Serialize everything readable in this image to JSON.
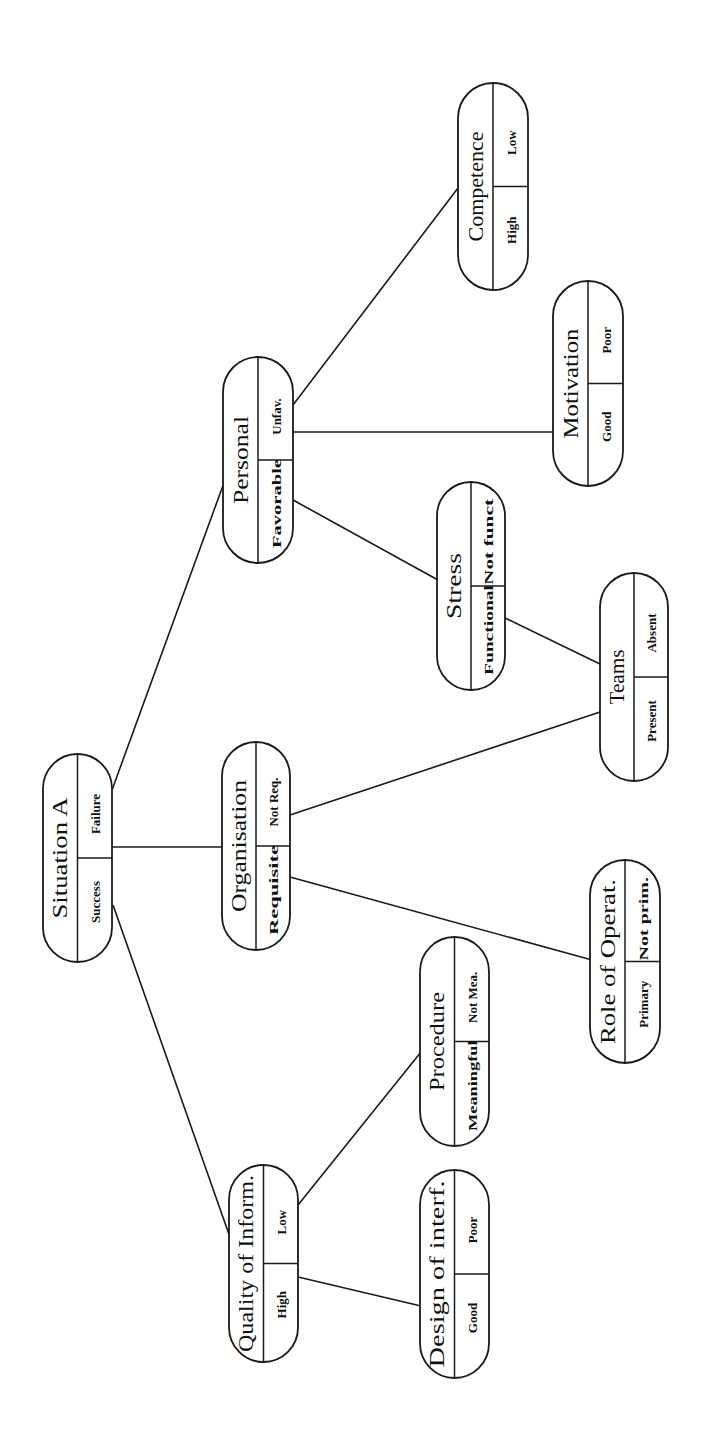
{
  "diagram": {
    "orientation": "rotated-90-ccw",
    "nodes": [
      {
        "id": "situation-a",
        "title": "Situation A",
        "left": "Success",
        "right": "Failure",
        "x": 43,
        "y": 754,
        "w": 69,
        "h": 208
      },
      {
        "id": "personal",
        "title": "Personal",
        "left": "Favorable",
        "right": "Unfav.",
        "x": 223,
        "y": 357,
        "w": 70,
        "h": 206
      },
      {
        "id": "organisation",
        "title": "Organisation",
        "left": "Requisite",
        "right": "Not Req.",
        "x": 222,
        "y": 742,
        "w": 68,
        "h": 208
      },
      {
        "id": "quality-of-inform",
        "title": "Quality of Inform.",
        "left": "High",
        "right": "Low",
        "x": 229,
        "y": 1165,
        "w": 69,
        "h": 197
      },
      {
        "id": "competence",
        "title": "Competence",
        "left": "High",
        "right": "Low",
        "x": 458,
        "y": 83,
        "w": 70,
        "h": 207
      },
      {
        "id": "motivation",
        "title": "Motivation",
        "left": "Good",
        "right": "Poor",
        "x": 553,
        "y": 281,
        "w": 70,
        "h": 205
      },
      {
        "id": "stress",
        "title": "Stress",
        "left": "Functional",
        "right": "Not funct",
        "x": 437,
        "y": 482,
        "w": 68,
        "h": 208
      },
      {
        "id": "teams",
        "title": "Teams",
        "left": "Present",
        "right": "Absent",
        "x": 600,
        "y": 573,
        "w": 68,
        "h": 208
      },
      {
        "id": "role-of-operat",
        "title": "Role of Operat.",
        "left": "Primary",
        "right": "Not prim.",
        "x": 590,
        "y": 860,
        "w": 70,
        "h": 203
      },
      {
        "id": "procedure",
        "title": "Procedure",
        "left": "Meaningful",
        "right": "Not Mea.",
        "x": 420,
        "y": 937,
        "w": 69,
        "h": 209
      },
      {
        "id": "design-of-interf",
        "title": "Design of interf.",
        "left": "Good",
        "right": "Poor",
        "x": 420,
        "y": 1170,
        "w": 69,
        "h": 208
      }
    ],
    "edges": [
      {
        "from": "situation-a",
        "to": "personal",
        "x1": 112,
        "y1": 790,
        "x2": 225,
        "y2": 480
      },
      {
        "from": "situation-a",
        "to": "organisation",
        "x1": 112,
        "y1": 847,
        "x2": 222,
        "y2": 847
      },
      {
        "from": "situation-a",
        "to": "quality-of-inform",
        "x1": 113,
        "y1": 905,
        "x2": 231,
        "y2": 1240
      },
      {
        "from": "personal",
        "to": "competence",
        "x1": 293,
        "y1": 405,
        "x2": 458,
        "y2": 188
      },
      {
        "from": "personal",
        "to": "motivation",
        "x1": 293,
        "y1": 432,
        "x2": 553,
        "y2": 432
      },
      {
        "from": "personal",
        "to": "stress",
        "x1": 293,
        "y1": 500,
        "x2": 438,
        "y2": 580
      },
      {
        "from": "stress",
        "to": "teams",
        "x1": 505,
        "y1": 618,
        "x2": 600,
        "y2": 664
      },
      {
        "from": "organisation",
        "to": "teams",
        "x1": 290,
        "y1": 815,
        "x2": 600,
        "y2": 712
      },
      {
        "from": "organisation",
        "to": "role-of-operat",
        "x1": 290,
        "y1": 877,
        "x2": 592,
        "y2": 960
      },
      {
        "from": "quality-of-inform",
        "to": "procedure",
        "x1": 298,
        "y1": 1205,
        "x2": 421,
        "y2": 1052
      },
      {
        "from": "quality-of-inform",
        "to": "design-of-interf",
        "x1": 298,
        "y1": 1277,
        "x2": 421,
        "y2": 1306
      }
    ]
  }
}
